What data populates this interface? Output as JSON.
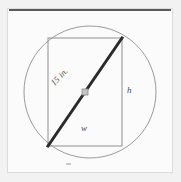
{
  "figure": {
    "background_color": "#f2f2f2",
    "page_color": "#fbfbfb",
    "frame_border_color": "#dcdcdc",
    "top_rule_color": "#5a5a5a",
    "labels": {
      "diagonal": "15 in.",
      "height": "h",
      "width": "w"
    }
  },
  "chart_data": {
    "type": "diagram",
    "shapes": [
      {
        "name": "circle",
        "kind": "circle",
        "cx": 90,
        "cy": 92,
        "r": 66,
        "stroke": "#9a9a9a",
        "stroke_width": 1,
        "fill": "none"
      },
      {
        "name": "rectangle",
        "kind": "rect",
        "x": 48,
        "y": 38,
        "width": 74,
        "height": 108,
        "stroke": "#8f8f8f",
        "stroke_width": 1,
        "fill": "none"
      },
      {
        "name": "diagonal",
        "kind": "line",
        "x1": 48,
        "y1": 146,
        "x2": 122,
        "y2": 38,
        "stroke": "#2b2b2b",
        "stroke_width": 3
      },
      {
        "name": "center-marker",
        "kind": "square",
        "cx": 85,
        "cy": 92,
        "size": 6,
        "fill": "#c4c4c4",
        "stroke": "#8a8a8a"
      }
    ],
    "annotations": [
      {
        "name": "diagonal-label",
        "text": "15 in.",
        "x": 52,
        "y": 79,
        "rotation": -46
      },
      {
        "name": "height-label",
        "text": "h",
        "x": 127,
        "y": 85,
        "rotation": 0
      },
      {
        "name": "width-label",
        "text": "w",
        "x": 81,
        "y": 123,
        "rotation": 0
      }
    ]
  }
}
